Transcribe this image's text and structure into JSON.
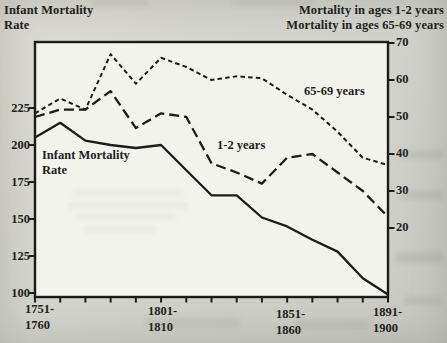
{
  "header": {
    "left_title_lines": [
      "Infant Mortality",
      "Rate"
    ],
    "right_title_lines": [
      "Mortality  in ages 1-2 years",
      "Mortality in ages 65-69 years"
    ]
  },
  "chart_data": {
    "type": "line",
    "categories": [
      "1751-1760",
      "1761-1770",
      "1771-1780",
      "1781-1790",
      "1791-1800",
      "1801-1810",
      "1811-1820",
      "1821-1830",
      "1831-1840",
      "1841-1850",
      "1851-1860",
      "1861-1870",
      "1871-1880",
      "1881-1890",
      "1891-1900"
    ],
    "x_axis": {
      "tick_labels": [
        {
          "category_index": 0,
          "lines": [
            "1751-",
            "1760"
          ]
        },
        {
          "category_index": 5,
          "lines": [
            "1801-",
            "1810"
          ]
        },
        {
          "category_index": 10,
          "lines": [
            "1851-",
            "1860"
          ]
        },
        {
          "category_index": 14,
          "lines": [
            "1891-",
            "1900"
          ]
        }
      ]
    },
    "left_axis": {
      "label": "Infant Mortality Rate",
      "ticks": [
        225,
        200,
        175,
        150,
        125,
        100
      ],
      "range": [
        97,
        270
      ]
    },
    "right_axis": {
      "label": "Mortality in ages 1-2 years / 65-69 years",
      "ticks": [
        70,
        60,
        50,
        40,
        30,
        20
      ],
      "range": [
        1,
        70
      ]
    },
    "grid": false,
    "legend_position": "labels-on-lines",
    "series": [
      {
        "name": "Infant Mortality Rate",
        "axis": "left",
        "line_style": "solid",
        "values": [
          205,
          215,
          203,
          200,
          198,
          200,
          183,
          166,
          166,
          151,
          145,
          136,
          128,
          110,
          99
        ]
      },
      {
        "name": "1-2 years",
        "axis": "right",
        "line_style": "long-dash",
        "values": [
          50,
          52,
          52,
          57,
          47,
          51,
          50,
          37.5,
          35,
          32,
          39,
          40,
          35,
          30,
          23
        ]
      },
      {
        "name": "65-69 years",
        "axis": "right",
        "line_style": "short-dash",
        "values": [
          51,
          55,
          52,
          67,
          59,
          66,
          63.5,
          60,
          61,
          60.5,
          56,
          52,
          46,
          39,
          37
        ]
      }
    ],
    "annotations": [
      {
        "id": "infant-label",
        "lines": [
          "Infant Mortality",
          "Rate"
        ]
      },
      {
        "id": "label-1-2",
        "lines": [
          "1-2 years"
        ]
      },
      {
        "id": "label-65-69",
        "lines": [
          "65-69 years"
        ]
      }
    ],
    "colors": {
      "line": "#1c1c1c",
      "paper": "#f3f3ee",
      "page_bg": "#d4d5cf",
      "text": "#21211c"
    }
  }
}
